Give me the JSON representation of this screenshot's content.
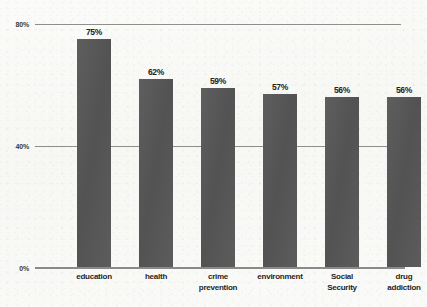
{
  "chart_data": {
    "type": "bar",
    "title": "",
    "subtitle": "",
    "xlabel": "",
    "ylabel": "",
    "categories": [
      "education",
      "health",
      "crime prevention",
      "environment",
      "Social Security",
      "drug addiction"
    ],
    "category_lines": [
      [
        "education"
      ],
      [
        "health"
      ],
      [
        "crime",
        "prevention"
      ],
      [
        "environment"
      ],
      [
        "Social",
        "Security"
      ],
      [
        "drug",
        "addiction"
      ]
    ],
    "values": [
      75,
      62,
      59,
      57,
      56,
      56
    ],
    "data_labels": [
      "75%",
      "62%",
      "59%",
      "57%",
      "56%",
      "56%"
    ],
    "ylim": [
      0,
      80
    ],
    "yticks": [
      0,
      40,
      80
    ],
    "ytick_labels": [
      "0%",
      "40%",
      "80%"
    ],
    "grid": true,
    "gridlines_at": [
      40,
      80
    ],
    "legend": null,
    "legend_position": "none",
    "bar_color": "#575757",
    "gridline_color": "#8e8e8e",
    "axis_color": "#8a8a8a",
    "background_color": "#fbfbf9",
    "label_color": "#232323"
  }
}
